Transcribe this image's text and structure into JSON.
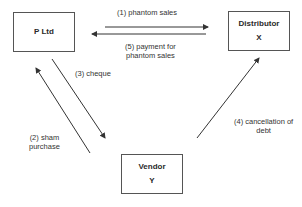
{
  "diagram": {
    "nodes": [
      {
        "id": "p_ltd",
        "title": "P Ltd",
        "sub": ""
      },
      {
        "id": "distributor",
        "title": "Distributor",
        "sub": "X"
      },
      {
        "id": "vendor",
        "title": "Vendor",
        "sub": "Y"
      }
    ],
    "edges": [
      {
        "id": "e1",
        "from": "p_ltd",
        "to": "distributor",
        "label": "(1) phantom sales"
      },
      {
        "id": "e2",
        "from": "vendor",
        "to": "p_ltd",
        "label_line1": "(2) sham",
        "label_line2": "purchase"
      },
      {
        "id": "e3",
        "from": "p_ltd",
        "to": "vendor",
        "label": "(3) cheque"
      },
      {
        "id": "e4",
        "from": "vendor",
        "to": "distributor",
        "label_line1": "(4) cancellation of",
        "label_line2": "debt"
      },
      {
        "id": "e5",
        "from": "distributor",
        "to": "p_ltd",
        "label_line1": "(5) payment for",
        "label_line2": "phantom sales"
      }
    ],
    "colors": {
      "line": "#333333",
      "box_border": "#555555",
      "text": "#2a2a2a"
    }
  }
}
